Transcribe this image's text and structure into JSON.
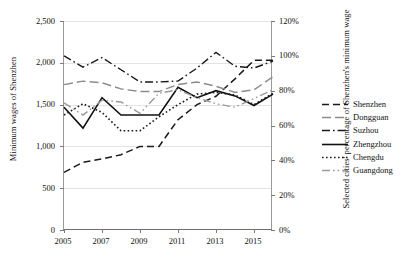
{
  "chart_data": {
    "type": "line",
    "title": "",
    "xlabel": "",
    "ylabel": "Minimum wages of Shenzhen",
    "y2label": "Selected cities' percentage of Shenzhen's minimum wage",
    "x": [
      2005,
      2006,
      2007,
      2008,
      2009,
      2010,
      2011,
      2012,
      2013,
      2014,
      2015,
      2016
    ],
    "xticks": [
      "2005",
      "2007",
      "2009",
      "2011",
      "2013",
      "2015"
    ],
    "xtick_values": [
      2005,
      2007,
      2009,
      2011,
      2013,
      2015
    ],
    "yticks": [
      "0",
      "500",
      "1,000",
      "1,500",
      "2,000",
      "2,500"
    ],
    "ytick_values": [
      0,
      500,
      1000,
      1500,
      2000,
      2500
    ],
    "ylim": [
      0,
      2500
    ],
    "y2ticks": [
      "0%",
      "20%",
      "40%",
      "60%",
      "80%",
      "100%",
      "120%"
    ],
    "y2tick_values": [
      0,
      20,
      40,
      60,
      80,
      100,
      120
    ],
    "y2lim": [
      0,
      120
    ],
    "grid": true,
    "legend_position": "right",
    "series": [
      {
        "name": "Shenzhen",
        "axis": "left",
        "style": "dashed",
        "color": "#1a1a1a",
        "values": [
          690,
          810,
          850,
          900,
          1000,
          1000,
          1320,
          1500,
          1600,
          1808,
          2030,
          2030
        ]
      },
      {
        "name": "Dongguan",
        "axis": "right",
        "style": "long-dash",
        "color": "#8c8c8c",
        "values": [
          83.5,
          85.5,
          84.5,
          81.0,
          79.5,
          79.5,
          83.5,
          85.0,
          82.5,
          79.0,
          80.5,
          88.0
        ]
      },
      {
        "name": "Suzhou",
        "axis": "right",
        "style": "dash-dot",
        "color": "#1a1a1a",
        "values": [
          100.0,
          93.5,
          99.0,
          92.0,
          85.0,
          85.0,
          85.5,
          93.0,
          102.0,
          94.0,
          93.0,
          97.0
        ]
      },
      {
        "name": "Zhengzhou",
        "axis": "right",
        "style": "solid",
        "color": "#111111",
        "values": [
          70.5,
          58.5,
          76.0,
          66.0,
          66.0,
          66.0,
          82.0,
          76.0,
          80.0,
          77.0,
          71.5,
          78.0
        ]
      },
      {
        "name": "Chengdu",
        "axis": "right",
        "style": "dotted",
        "color": "#1a1a1a",
        "values": [
          66.0,
          72.5,
          67.5,
          57.0,
          57.0,
          65.0,
          72.0,
          78.0,
          79.0,
          77.5,
          72.0,
          78.5
        ]
      },
      {
        "name": "Guangdong",
        "axis": "right",
        "style": "dash-dot-dot",
        "color": "#9a9a9a",
        "values": [
          73.0,
          66.0,
          74.5,
          73.5,
          67.0,
          78.5,
          80.5,
          76.0,
          72.5,
          70.5,
          75.5,
          80.5
        ]
      }
    ]
  },
  "legend": {
    "items": [
      {
        "label": "Shenzhen"
      },
      {
        "label": "Dongguan"
      },
      {
        "label": "Suzhou"
      },
      {
        "label": "Zhengzhou"
      },
      {
        "label": "Chengdu"
      },
      {
        "label": "Guangdong"
      }
    ]
  }
}
